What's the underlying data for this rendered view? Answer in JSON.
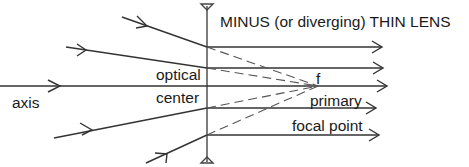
{
  "diagram": {
    "title": "MINUS (or diverging) THIN LENS",
    "labels": {
      "optical": "optical",
      "center": "center",
      "axis": "axis",
      "focal_length": "f",
      "primary": "primary",
      "focal_point": "focal point"
    },
    "lens": {
      "type": "diverging",
      "x": 207,
      "y_top": 5,
      "y_bottom": 162
    },
    "focal_point": {
      "x": 318,
      "y": 86
    },
    "rays": [
      {
        "name": "ray-1",
        "start": [
          122,
          17
        ],
        "lens_hit": [
          207,
          47
        ],
        "end": [
          382,
          47
        ]
      },
      {
        "name": "ray-2",
        "start": [
          66,
          47
        ],
        "lens_hit": [
          207,
          68
        ],
        "end": [
          383,
          68
        ]
      },
      {
        "name": "optical-axis",
        "start": [
          0,
          86
        ],
        "lens_hit": [
          207,
          86
        ],
        "end": [
          387,
          86
        ]
      },
      {
        "name": "ray-4",
        "start": [
          54,
          138
        ],
        "lens_hit": [
          207,
          108
        ],
        "end": [
          376,
          108
        ]
      },
      {
        "name": "ray-5",
        "start": [
          146,
          163
        ],
        "lens_hit": [
          207,
          135
        ],
        "end": [
          379,
          135
        ]
      }
    ],
    "colors": {
      "line": "#333333",
      "dashed": "#555555",
      "text": "#1a1a1a",
      "background": "#ffffff"
    }
  }
}
